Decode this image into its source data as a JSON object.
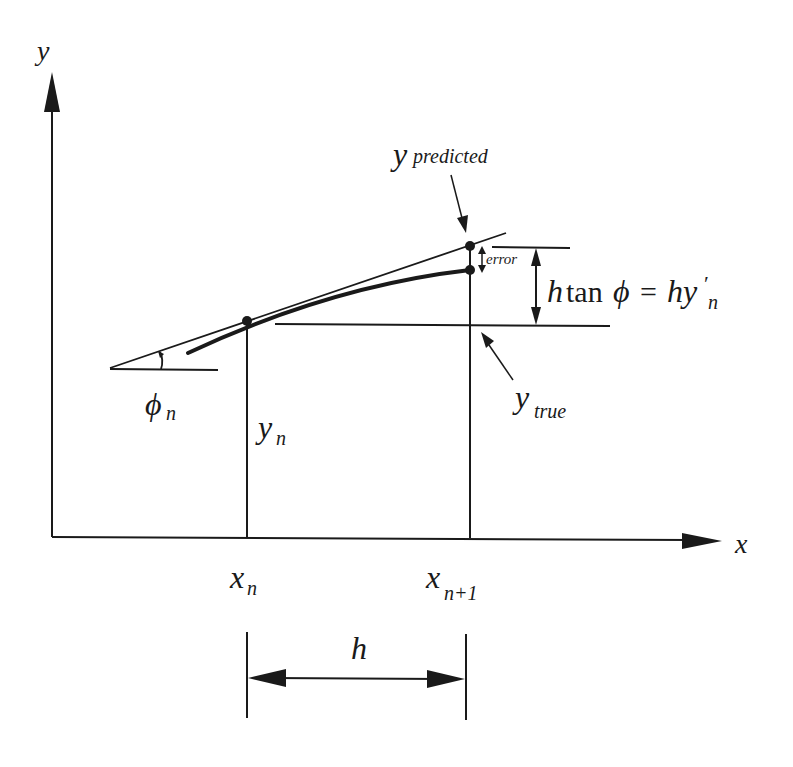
{
  "figure": {
    "axes": {
      "x_label": "x",
      "y_label": "y"
    },
    "labels": {
      "y_predicted_base": "y",
      "y_predicted_sub": "predicted",
      "y_true_base": "y",
      "y_true_sub": "true",
      "error": "error",
      "increment_h": "h",
      "increment_tan": "tan",
      "increment_phi": "ϕ",
      "increment_eq": "=",
      "increment_rhs_base": "hy",
      "increment_rhs_prime": "′",
      "increment_rhs_sub": "n",
      "phi_base": "ϕ",
      "phi_sub": "n",
      "yn_base": "y",
      "yn_sub": "n",
      "xn_base": "x",
      "xn_sub": "n",
      "xn1_base": "x",
      "xn1_sub": "n+1",
      "step": "h"
    },
    "colors": {
      "ink": "#1a1a1a",
      "background": "#ffffff"
    }
  }
}
